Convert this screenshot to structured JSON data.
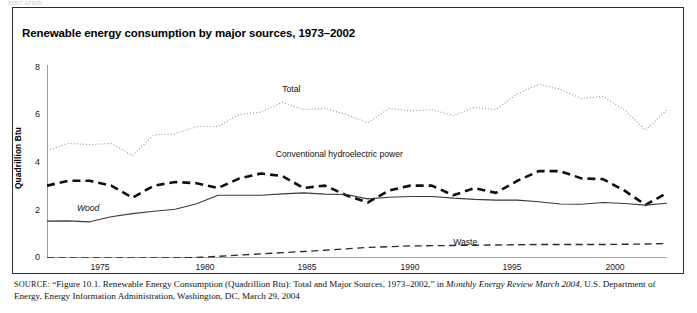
{
  "page": {
    "cutoff_header": "EDUCATION"
  },
  "figure": {
    "title": "Renewable energy consumption by major sources, 1973–2002",
    "y_axis_title": "Quadrillion Btu"
  },
  "source": {
    "label": "SOURCE:",
    "line1_a": " “Figure 10.1. Renewable Energy Consumption (Quadrillion Btu): Total and Major Sources, 1973–2002,” in ",
    "line1_italic": "Monthly Energy Review March 2004",
    "line1_b": ",",
    "line2": "U.S. Department of Energy, Energy Information Administration, Washington, DC, March 29, 2004"
  },
  "chart_data": {
    "type": "line",
    "title": "Renewable energy consumption by major sources, 1973–2002",
    "xlabel": "",
    "ylabel": "Quadrillion Btu",
    "xlim": [
      1973,
      2002
    ],
    "ylim": [
      0,
      8
    ],
    "yticks": [
      0,
      2,
      4,
      6,
      8
    ],
    "xticks": [
      1975,
      1980,
      1985,
      1990,
      1995,
      2000
    ],
    "grid": false,
    "legend": "inline-annotations",
    "x": [
      1973,
      1974,
      1975,
      1976,
      1977,
      1978,
      1979,
      1980,
      1981,
      1982,
      1983,
      1984,
      1985,
      1986,
      1987,
      1988,
      1989,
      1990,
      1991,
      1992,
      1993,
      1994,
      1995,
      1996,
      1997,
      1998,
      1999,
      2000,
      2001,
      2002
    ],
    "series": [
      {
        "name": "Total",
        "style": "dotted",
        "label_x": 1984.0,
        "label_y": 6.95,
        "values": [
          4.45,
          4.75,
          4.7,
          4.75,
          4.25,
          5.1,
          5.15,
          5.45,
          5.45,
          5.95,
          6.05,
          6.45,
          6.15,
          6.2,
          5.95,
          5.6,
          6.2,
          6.1,
          6.15,
          5.9,
          6.25,
          6.15,
          6.8,
          7.2,
          7.0,
          6.6,
          6.7,
          6.15,
          5.3,
          6.15
        ]
      },
      {
        "name": "Conventional hydroelectric power",
        "style": "dashed-thick",
        "label_x": 1983.7,
        "label_y": 4.25,
        "values": [
          3.0,
          3.2,
          3.2,
          3.0,
          2.5,
          3.0,
          3.15,
          3.1,
          2.9,
          3.3,
          3.5,
          3.4,
          2.9,
          3.0,
          2.6,
          2.3,
          2.8,
          3.0,
          3.0,
          2.6,
          2.9,
          2.7,
          3.2,
          3.6,
          3.6,
          3.3,
          3.27,
          2.8,
          2.2,
          2.7
        ]
      },
      {
        "name": "Wood",
        "style": "solid",
        "label_x": 1974.4,
        "label_y": 2.02,
        "values": [
          1.53,
          1.54,
          1.5,
          1.71,
          1.84,
          1.94,
          2.02,
          2.25,
          2.6,
          2.6,
          2.6,
          2.66,
          2.7,
          2.65,
          2.63,
          2.45,
          2.52,
          2.55,
          2.55,
          2.48,
          2.43,
          2.4,
          2.4,
          2.33,
          2.24,
          2.23,
          2.3,
          2.26,
          2.19,
          2.27
        ]
      },
      {
        "name": "Waste",
        "style": "dashed-thin",
        "label_x": 1992.0,
        "label_y": 0.62,
        "values": [
          0.0,
          0.0,
          0.0,
          0.0,
          0.0,
          0.0,
          0.0,
          0.02,
          0.07,
          0.12,
          0.17,
          0.22,
          0.27,
          0.32,
          0.38,
          0.44,
          0.47,
          0.5,
          0.51,
          0.52,
          0.53,
          0.54,
          0.55,
          0.56,
          0.56,
          0.56,
          0.56,
          0.57,
          0.58,
          0.6
        ]
      }
    ]
  }
}
